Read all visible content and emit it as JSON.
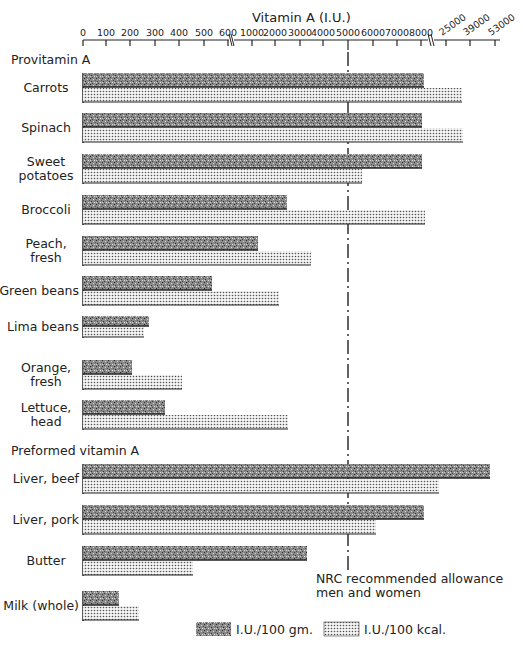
{
  "chart_data": {
    "type": "bar",
    "orientation": "horizontal",
    "title": "Vitamin A (I.U.)",
    "xlabel": "Vitamin A (I.U.)",
    "ylabel": "",
    "axis_position": "top",
    "axis_broken": true,
    "tick_labels": [
      "0",
      "100",
      "200",
      "300",
      "400",
      "500",
      "600",
      "1000",
      "2000",
      "3000",
      "4000",
      "5000",
      "6000",
      "7000",
      "8000",
      "25000",
      "39000",
      "53000"
    ],
    "ticks": [
      0,
      100,
      200,
      300,
      400,
      500,
      600,
      1000,
      2000,
      3000,
      4000,
      5000,
      6000,
      7000,
      8000,
      25000,
      39000,
      53000
    ],
    "grid": false,
    "legend_position": "bottom",
    "groups": [
      {
        "name": "Provitamin A",
        "categories": [
          "Carrots",
          "Spinach",
          "Sweet potatoes",
          "Broccoli",
          "Peach, fresh",
          "Green beans",
          "Lima beans",
          "Orange, fresh",
          "Lettuce, head"
        ]
      },
      {
        "name": "Preformed vitamin A",
        "categories": [
          "Liver, beef",
          "Liver, pork",
          "Butter",
          "Milk (whole)"
        ]
      }
    ],
    "categories": [
      "Carrots",
      "Spinach",
      "Sweet potatoes",
      "Broccoli",
      "Peach, fresh",
      "Green beans",
      "Lima beans",
      "Orange, fresh",
      "Lettuce, head",
      "Liver, beef",
      "Liver, pork",
      "Butter",
      "Milk (whole)"
    ],
    "series": [
      {
        "name": "I.U./100 gm.",
        "pattern": "dark stipple",
        "values": [
          11000,
          10000,
          8800,
          2500,
          1330,
          540,
          280,
          200,
          330,
          50000,
          10500,
          3300,
          150
        ]
      },
      {
        "name": "I.U./100 kcal.",
        "pattern": "light dotted",
        "values": [
          34000,
          35000,
          5600,
          8000,
          3450,
          2100,
          250,
          410,
          2500,
          17000,
          6100,
          450,
          230
        ]
      }
    ],
    "reference_line": {
      "value": 5000,
      "label": "NRC recommended allowance men and women",
      "style": "dashed"
    }
  },
  "labels": {
    "axis_title": "Vitamin A (I.U.)",
    "group_provitamin": "Provitamin A",
    "group_preformed": "Preformed vitamin A",
    "nrc_line1": "NRC recommended allowance",
    "nrc_line2": "men and women",
    "legend_gm": "I.U./100 gm.",
    "legend_kcal": "I.U./100 kcal."
  },
  "rows": [
    {
      "label": [
        "Carrots"
      ],
      "dark_end": 424,
      "light_end": 462,
      "top": 73
    },
    {
      "label": [
        "Spinach"
      ],
      "dark_end": 422,
      "light_end": 463,
      "top": 113
    },
    {
      "label": [
        "Sweet",
        "potatoes"
      ],
      "dark_end": 422,
      "light_end": 362,
      "top": 154
    },
    {
      "label": [
        "Broccoli"
      ],
      "dark_end": 287,
      "light_end": 425,
      "top": 195
    },
    {
      "label": [
        "Peach,",
        "fresh"
      ],
      "dark_end": 258,
      "light_end": 311,
      "top": 236
    },
    {
      "label": [
        "Green beans"
      ],
      "dark_end": 212,
      "light_end": 279,
      "top": 276
    },
    {
      "label": [
        "Lima beans"
      ],
      "dark_end": 149,
      "light_end": 144,
      "top": 316
    },
    {
      "label": [
        "Orange,",
        "fresh"
      ],
      "dark_end": 132,
      "light_end": 182,
      "top": 360
    },
    {
      "label": [
        "Lettuce,",
        "head"
      ],
      "dark_end": 165,
      "light_end": 288,
      "top": 400
    },
    {
      "label": [
        "Liver, beef"
      ],
      "dark_end": 490,
      "light_end": 439,
      "top": 464
    },
    {
      "label": [
        "Liver, pork"
      ],
      "dark_end": 424,
      "light_end": 376,
      "top": 505
    },
    {
      "label": [
        "Butter"
      ],
      "dark_end": 307,
      "light_end": 193,
      "top": 546
    },
    {
      "label": [
        "Milk (whole)"
      ],
      "dark_end": 119,
      "light_end": 139,
      "top": 591
    }
  ],
  "tick_px": [
    83,
    106,
    130,
    155,
    179,
    204,
    228,
    252,
    275,
    300,
    323,
    348,
    373,
    397,
    421,
    446,
    470,
    495
  ]
}
